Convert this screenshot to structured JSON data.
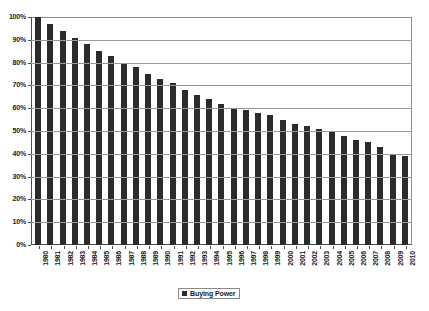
{
  "chart_data": {
    "type": "bar",
    "title": "",
    "subtitle": "",
    "xlabel": "",
    "ylabel": "",
    "ylim": [
      0,
      100
    ],
    "yticks": [
      "0%",
      "10%",
      "20%",
      "30%",
      "40%",
      "50%",
      "60%",
      "70%",
      "80%",
      "90%",
      "100%"
    ],
    "grid": true,
    "legend_position": "bottom-center",
    "legend": [
      "Buying Power"
    ],
    "series_color": "#2b2b2b",
    "categories": [
      "1980",
      "1981",
      "1982",
      "1983",
      "1984",
      "1985",
      "1986",
      "1987",
      "1988",
      "1989",
      "1990",
      "1991",
      "1992",
      "1993",
      "1994",
      "1995",
      "1996",
      "1997",
      "1998",
      "1999",
      "2000",
      "2001",
      "2002",
      "2003",
      "2004",
      "2005",
      "2006",
      "2007",
      "2008",
      "2009",
      "2010"
    ],
    "series": [
      {
        "name": "Buying Power",
        "values": [
          100,
          97,
          94,
          91,
          88,
          85,
          83,
          80,
          78,
          75,
          73,
          71,
          68,
          66,
          64,
          62,
          60,
          59,
          58,
          57,
          55,
          53,
          52,
          51,
          50,
          48,
          46,
          45,
          43,
          40,
          39
        ]
      }
    ]
  },
  "legend": {
    "entry_label": "Buying Power"
  }
}
